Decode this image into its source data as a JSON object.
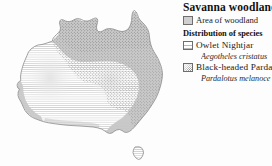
{
  "figure": {
    "type": "thematic-distribution-map",
    "region": "Australia"
  },
  "legend": {
    "title": "Savanna woodland",
    "habitat": {
      "label": "Area of woodland",
      "swatch": "solid-gray-fill",
      "color": "#cfcfcf"
    },
    "subheading": "Distribution of species",
    "species": [
      {
        "common_name": "Owlet Nightjar",
        "scientific_name": "Aegotheles cristatus",
        "swatch": "horizontal-line-hatch",
        "color": "#b9b9b9"
      },
      {
        "common_name": "Black-headed Pardal",
        "scientific_name": "Pardalotus melanoce",
        "swatch": "stipple-dots",
        "color": "#8a8a8a"
      }
    ]
  },
  "map": {
    "name": "Australia",
    "outline_color": "#8c8c8c",
    "woodland_fill": "#c6c6c6",
    "hatch_color": "#bdbdbd",
    "stipple_color": "#8f8f8f",
    "islands": [
      "Mainland Australia",
      "Tasmania"
    ]
  }
}
